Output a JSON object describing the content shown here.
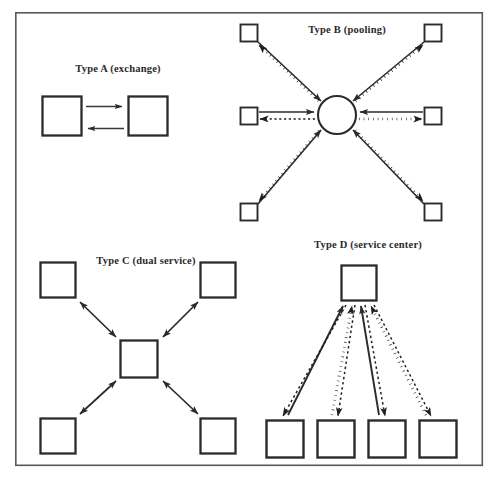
{
  "figure": {
    "background_color": "#ffffff",
    "frame_color": "#585858",
    "ink_color": "#2b2b2b",
    "panels": [
      {
        "id": "type-a",
        "label": "Type A (exchange)",
        "label_x": 118,
        "label_y": 72,
        "nodes": [
          {
            "name": "left-square",
            "shape": "square",
            "x": 42,
            "y": 96,
            "w": 40,
            "h": 40
          },
          {
            "name": "right-square",
            "shape": "square",
            "x": 128,
            "y": 96,
            "w": 40,
            "h": 40
          }
        ],
        "connectors": [
          {
            "name": "left-to-right-arrow",
            "style": "solid",
            "heads": "end",
            "from": [
              86,
              106
            ],
            "to": [
              124,
              106
            ]
          },
          {
            "name": "right-to-left-arrow",
            "style": "solid",
            "heads": "end",
            "from": [
              124,
              128
            ],
            "to": [
              86,
              128
            ]
          }
        ]
      },
      {
        "id": "type-b",
        "label": "Type B (pooling)",
        "label_x": 347,
        "label_y": 33,
        "hub": {
          "name": "pool-circle",
          "shape": "circle",
          "cx": 337,
          "cy": 115,
          "r": 19
        },
        "nodes": [
          {
            "name": "node-top-left",
            "shape": "square",
            "x": 240,
            "y": 24,
            "w": 18,
            "h": 18
          },
          {
            "name": "node-top-right",
            "shape": "square",
            "x": 424,
            "y": 24,
            "w": 18,
            "h": 18
          },
          {
            "name": "node-mid-left",
            "shape": "square",
            "x": 240,
            "y": 107,
            "w": 18,
            "h": 18
          },
          {
            "name": "node-mid-right",
            "shape": "square",
            "x": 424,
            "y": 107,
            "w": 18,
            "h": 18
          },
          {
            "name": "node-bottom-left",
            "shape": "square",
            "x": 240,
            "y": 203,
            "w": 18,
            "h": 18
          },
          {
            "name": "node-bottom-right",
            "shape": "square",
            "x": 424,
            "y": 203,
            "w": 18,
            "h": 18
          }
        ],
        "inbound_style": "solid",
        "outbound_style": "dotted"
      },
      {
        "id": "type-c",
        "label": "Type C (dual service)",
        "label_x": 146,
        "label_y": 264,
        "hub": {
          "name": "center-square",
          "shape": "square",
          "x": 120,
          "y": 340,
          "w": 38,
          "h": 38
        },
        "nodes": [
          {
            "name": "node-top-left",
            "shape": "square",
            "x": 40,
            "y": 262,
            "w": 36,
            "h": 36
          },
          {
            "name": "node-top-right",
            "shape": "square",
            "x": 200,
            "y": 262,
            "w": 36,
            "h": 36
          },
          {
            "name": "node-bottom-left",
            "shape": "square",
            "x": 40,
            "y": 418,
            "w": 36,
            "h": 36
          },
          {
            "name": "node-bottom-right",
            "shape": "square",
            "x": 200,
            "y": 418,
            "w": 36,
            "h": 36
          }
        ],
        "connector_style": "solid-double-headed"
      },
      {
        "id": "type-d",
        "label": "Type D (service center)",
        "label_x": 368,
        "label_y": 248,
        "hub": {
          "name": "service-center-square",
          "shape": "square",
          "x": 341,
          "y": 265,
          "w": 36,
          "h": 36
        },
        "nodes": [
          {
            "name": "node-1",
            "shape": "square",
            "x": 266,
            "y": 420,
            "w": 38,
            "h": 38
          },
          {
            "name": "node-2",
            "shape": "square",
            "x": 317,
            "y": 420,
            "w": 38,
            "h": 38
          },
          {
            "name": "node-3",
            "shape": "square",
            "x": 368,
            "y": 420,
            "w": 38,
            "h": 38
          },
          {
            "name": "node-4",
            "shape": "square",
            "x": 419,
            "y": 420,
            "w": 38,
            "h": 38
          }
        ],
        "inbound_style": "solid",
        "outbound_style": "dotted"
      }
    ],
    "frame": {
      "x": 15,
      "y": 12,
      "w": 468,
      "h": 454
    }
  }
}
